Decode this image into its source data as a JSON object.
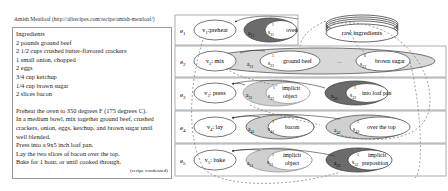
{
  "recipe": {
    "title": "Amish Meatloaf (http://allrecipes.com/recipe/amish-meatloaf/)",
    "ingredients_heading": "Ingredients",
    "ingredients": [
      "2 pounds ground beef",
      "2 1/2 cups crushed butter-flavored crackers",
      "1 small onion, chopped",
      "2 eggs",
      "3/4 cup ketchup",
      "1/4 cup brown sugar",
      "2 slices bacon"
    ],
    "steps": [
      "Preheat the oven to 350 degrees F (175 degrees C).",
      "In a medium bowl, mix together ground beef, crushed",
      "crackers, onion, eggs, ketchup, and brown sugar until",
      "well blended.",
      "Press into a 9x5 inch loaf pan.",
      "Lay the two slices of bacon over the top.",
      "Bake for 1 hour, or until cooked through."
    ],
    "note": "(recipe condensed)"
  },
  "graph": {
    "raw_ingredients_label": "raw ingredients",
    "ellipsis": "...",
    "rows": [
      {
        "event": "e1",
        "event_sub": "1",
        "verb": "v1: preheat",
        "args": [
          {
            "a": "a11",
            "s": "s11",
            "sup": "1",
            "text": "oven",
            "shade": "dark"
          }
        ]
      },
      {
        "event": "e2",
        "event_sub": "2",
        "verb": "v2: mix",
        "args": [
          {
            "a": "a21",
            "s": "s21",
            "sup": "1",
            "text": "ground beef",
            "shade": "light"
          },
          {
            "a": "",
            "s": "s21",
            "sup": "6",
            "text": "brown sugar",
            "shade": "light"
          }
        ]
      },
      {
        "event": "e3",
        "event_sub": "3",
        "verb": "v3: press",
        "args": [
          {
            "a": "a31",
            "s": "s31",
            "sup": "1",
            "text": "implicit object",
            "shade": "light"
          },
          {
            "a": "a32",
            "s": "s32",
            "sup": "1",
            "text": "into loaf pan",
            "shade": "dark"
          }
        ]
      },
      {
        "event": "e4",
        "event_sub": "4",
        "verb": "v4: lay",
        "args": [
          {
            "a": "a41",
            "s": "s41",
            "sup": "1",
            "text": "bacon",
            "shade": "light"
          },
          {
            "a": "a42",
            "s": "s42",
            "sup": "1",
            "text": "over the top",
            "shade": "light"
          }
        ]
      },
      {
        "event": "e5",
        "event_sub": "5",
        "verb": "v5: bake",
        "args": [
          {
            "a": "a51",
            "s": "s51",
            "sup": "1",
            "text": "implicit object",
            "shade": "light"
          },
          {
            "a": "a52",
            "s": "s52",
            "sup": "1",
            "text": "implicit preposition",
            "shade": "dark"
          }
        ]
      }
    ],
    "colors": {
      "dark": "#6b6b6b",
      "light": "#cfcfcf",
      "border": "#888888"
    }
  }
}
